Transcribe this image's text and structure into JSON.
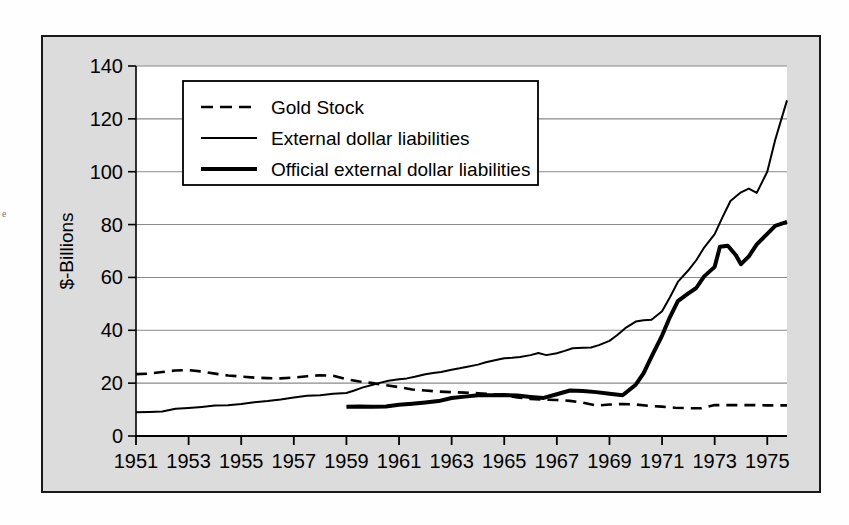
{
  "page": {
    "ghost_left_label": "e",
    "ghost_lines": [
      {
        "x": 96,
        "y": 44,
        "text": "regional and monetary"
      },
      {
        "x": 300,
        "y": 44,
        "text": "financial flows that"
      },
      {
        "x": 640,
        "y": 44,
        "text": "the dollar"
      },
      {
        "x": 96,
        "y": 86,
        "text": "external dollar liabilities"
      },
      {
        "x": 430,
        "y": 86,
        "text": "deficits"
      },
      {
        "x": 96,
        "y": 128,
        "text": "Official settlements and the"
      },
      {
        "x": 470,
        "y": 128,
        "text": "Bretton Woods"
      },
      {
        "x": 96,
        "y": 170,
        "text": "gold convertibility suspended"
      },
      {
        "x": 96,
        "y": 212,
        "text": "U.S. Wants.  Here are sure the  a also to provide"
      },
      {
        "x": 230,
        "y": 240,
        "text": "See in. Message by unit."
      },
      {
        "x": 96,
        "y": 268,
        "text": "A few all  (3) \"inter\" the arrangement"
      },
      {
        "x": 240,
        "y": 290,
        "text": "between the currencies of the Member States"
      },
      {
        "x": 96,
        "y": 330,
        "text": "exchange and internal rates  (Article  figures)"
      },
      {
        "x": 420,
        "y": 352,
        "text": "[1]  [ 2 ]"
      },
      {
        "x": 96,
        "y": 398,
        "text": "Die  schaft.  E  5  with the"
      },
      {
        "x": 300,
        "y": 398,
        "text": "1981  statement"
      },
      {
        "x": 96,
        "y": 470,
        "text": "Controls on the dollar and the"
      },
      {
        "x": 380,
        "y": 470,
        "text": "exchange rate"
      }
    ]
  },
  "chart_data": {
    "type": "line",
    "title": "",
    "xlabel": "",
    "ylabel": "$-Billions",
    "xlim": [
      1951,
      1975.75
    ],
    "ylim": [
      0,
      140
    ],
    "grid": true,
    "legend_position": "top-left",
    "x_ticks": [
      1951,
      1953,
      1955,
      1957,
      1959,
      1961,
      1963,
      1965,
      1967,
      1969,
      1971,
      1973,
      1975
    ],
    "x_tick_labels": [
      "1951",
      "1953",
      "1955",
      "1957",
      "1959",
      "1961",
      "1963",
      "1965",
      "1967",
      "1969",
      "1971",
      "1973",
      "1975"
    ],
    "y_ticks": [
      0,
      20,
      40,
      60,
      80,
      100,
      120,
      140
    ],
    "y_tick_labels": [
      "0",
      "20",
      "40",
      "60",
      "80",
      "100",
      "120",
      "140"
    ],
    "series": [
      {
        "name": "Gold Stock",
        "style": "dashed",
        "width": 2.6,
        "color": "#000000",
        "x": [
          1951.0,
          1951.5,
          1952.0,
          1952.5,
          1953.0,
          1953.5,
          1954.0,
          1954.5,
          1955.0,
          1955.5,
          1956.0,
          1956.5,
          1957.0,
          1957.5,
          1958.0,
          1958.5,
          1959.0,
          1959.5,
          1960.0,
          1960.5,
          1961.0,
          1961.5,
          1962.0,
          1962.5,
          1963.0,
          1963.5,
          1964.0,
          1964.5,
          1965.0,
          1965.5,
          1966.0,
          1966.5,
          1967.0,
          1967.5,
          1968.0,
          1968.5,
          1969.0,
          1969.5,
          1970.0,
          1970.5,
          1971.0,
          1971.5,
          1972.0,
          1972.5,
          1973.0,
          1973.5,
          1974.0,
          1974.5,
          1975.0,
          1975.75
        ],
        "y": [
          23.4,
          23.6,
          24.2,
          24.8,
          24.9,
          24.4,
          23.6,
          22.9,
          22.5,
          22.1,
          21.9,
          21.8,
          22.1,
          22.6,
          23.0,
          22.8,
          21.5,
          20.6,
          20.0,
          19.2,
          18.5,
          17.6,
          17.2,
          16.8,
          16.6,
          16.4,
          16.2,
          15.9,
          15.4,
          14.6,
          14.0,
          13.8,
          13.6,
          13.3,
          12.6,
          11.5,
          11.9,
          12.1,
          11.9,
          11.4,
          11.1,
          10.7,
          10.5,
          10.5,
          11.7,
          11.7,
          11.7,
          11.7,
          11.6,
          11.6
        ],
        "y_display": [
          23.4,
          23.6,
          24.2,
          24.8,
          24.9,
          24.4,
          23.6,
          22.9,
          22.5,
          22.1,
          21.9,
          21.8,
          22.1,
          22.6,
          23.0,
          22.8,
          21.5,
          20.6,
          20.0,
          19.2,
          18.5,
          17.6,
          17.2,
          16.8,
          16.6,
          16.4,
          16.2,
          15.9,
          15.4,
          14.6,
          14.0,
          13.8,
          13.6,
          13.3,
          12.6,
          11.5,
          11.9,
          12.1,
          11.9,
          11.4,
          11.1,
          10.7,
          10.5,
          10.5,
          11.7,
          11.7,
          11.7,
          11.7,
          11.6,
          11.6
        ]
      },
      {
        "name": "External dollar liabilities",
        "style": "solid-thin",
        "width": 2.0,
        "color": "#000000",
        "x": [
          1951.0,
          1951.5,
          1952.0,
          1952.5,
          1953.0,
          1953.5,
          1954.0,
          1954.5,
          1955.0,
          1955.5,
          1956.0,
          1956.5,
          1957.0,
          1957.5,
          1958.0,
          1958.5,
          1959.0,
          1959.3,
          1959.6,
          1960.0,
          1960.3,
          1960.6,
          1961.0,
          1961.3,
          1961.6,
          1962.0,
          1962.3,
          1962.6,
          1963.0,
          1963.3,
          1963.6,
          1964.0,
          1964.3,
          1964.6,
          1965.0,
          1965.3,
          1965.6,
          1966.0,
          1966.3,
          1966.6,
          1967.0,
          1967.3,
          1967.6,
          1968.0,
          1968.3,
          1968.6,
          1969.0,
          1969.3,
          1969.6,
          1970.0,
          1970.3,
          1970.6,
          1971.0,
          1971.3,
          1971.6,
          1972.0,
          1972.3,
          1972.6,
          1973.0,
          1973.3,
          1973.6,
          1974.0,
          1974.3,
          1974.6,
          1975.0,
          1975.3,
          1975.75
        ],
        "y": [
          9.0,
          9.1,
          9.3,
          10.3,
          10.6,
          11.0,
          11.5,
          11.6,
          12.1,
          12.8,
          13.2,
          13.8,
          14.6,
          15.2,
          15.4,
          16.0,
          16.3,
          17.2,
          18.3,
          19.4,
          20.2,
          20.9,
          21.5,
          21.8,
          22.4,
          23.4,
          23.8,
          24.2,
          25.1,
          25.6,
          26.2,
          27.0,
          27.9,
          28.6,
          29.4,
          29.6,
          29.9,
          30.6,
          31.4,
          30.6,
          31.3,
          32.2,
          33.2,
          33.4,
          33.5,
          34.4,
          36.0,
          38.2,
          40.8,
          43.3,
          43.8,
          44.0,
          47.2,
          52.5,
          58.3,
          62.7,
          66.5,
          71.3,
          76.4,
          82.8,
          88.9,
          92.2,
          93.6,
          92.0,
          100.0,
          112.0,
          127.0
        ],
        "y_display": [
          9.0,
          9.1,
          9.3,
          10.3,
          10.6,
          11.0,
          11.5,
          11.6,
          12.1,
          12.8,
          13.2,
          13.8,
          14.6,
          15.2,
          15.4,
          16.0,
          16.3,
          17.2,
          18.3,
          19.4,
          20.2,
          20.9,
          21.5,
          21.8,
          22.4,
          23.4,
          23.8,
          24.2,
          25.1,
          25.6,
          26.2,
          27.0,
          27.9,
          28.6,
          29.4,
          29.6,
          29.9,
          30.6,
          31.4,
          30.6,
          31.3,
          32.2,
          33.2,
          33.4,
          33.5,
          34.4,
          36.0,
          38.2,
          40.8,
          43.3,
          43.8,
          44.0,
          47.2,
          52.5,
          58.3,
          62.7,
          66.5,
          71.3,
          76.4,
          82.8,
          88.9,
          92.2,
          93.6,
          92.0,
          100.0,
          112.0,
          127.0
        ]
      },
      {
        "name": "Official external dollar liabilities",
        "style": "solid-thick",
        "width": 4.0,
        "color": "#000000",
        "x": [
          1959.0,
          1959.5,
          1960.0,
          1960.5,
          1961.0,
          1961.5,
          1962.0,
          1962.5,
          1963.0,
          1963.5,
          1964.0,
          1964.5,
          1965.0,
          1965.5,
          1966.0,
          1966.5,
          1967.0,
          1967.5,
          1968.0,
          1968.5,
          1969.0,
          1969.5,
          1970.0,
          1970.3,
          1970.6,
          1971.0,
          1971.3,
          1971.6,
          1972.0,
          1972.3,
          1972.6,
          1973.0,
          1973.2,
          1973.5,
          1973.8,
          1974.0,
          1974.3,
          1974.6,
          1975.0,
          1975.3,
          1975.75
        ],
        "y": [
          11.1,
          11.2,
          11.1,
          11.2,
          11.8,
          12.2,
          12.7,
          13.2,
          14.4,
          14.9,
          15.4,
          15.4,
          15.5,
          15.3,
          14.8,
          14.4,
          15.8,
          17.2,
          17.0,
          16.6,
          16.0,
          15.4,
          19.4,
          23.8,
          30.0,
          38.0,
          45.0,
          51.0,
          54.0,
          56.0,
          60.4,
          64.0,
          71.6,
          72.0,
          68.5,
          65.0,
          68.0,
          72.5,
          76.5,
          79.5,
          81.0
        ],
        "y_display": [
          11.1,
          11.2,
          11.1,
          11.2,
          11.8,
          12.2,
          12.7,
          13.2,
          14.4,
          14.9,
          15.4,
          15.4,
          15.5,
          15.3,
          14.8,
          14.4,
          15.8,
          17.2,
          17.0,
          16.6,
          16.0,
          15.4,
          19.4,
          23.8,
          30.0,
          38.0,
          45.0,
          51.0,
          54.0,
          56.0,
          60.4,
          64.0,
          71.6,
          72.0,
          68.5,
          65.0,
          68.0,
          72.5,
          76.5,
          79.5,
          81.0
        ]
      }
    ],
    "legend": [
      {
        "label": "Gold Stock",
        "style": "dashed",
        "width": 2.6
      },
      {
        "label": "External dollar liabilities",
        "style": "solid-thin",
        "width": 2.0
      },
      {
        "label": "Official external dollar liabilities",
        "style": "solid-thick",
        "width": 4.0
      }
    ],
    "colors": {
      "plot_background": "#ffffff",
      "figure_background": "#dcdcdc",
      "grid": "#8a8a8a",
      "axis": "#000000",
      "line": "#000000"
    }
  }
}
